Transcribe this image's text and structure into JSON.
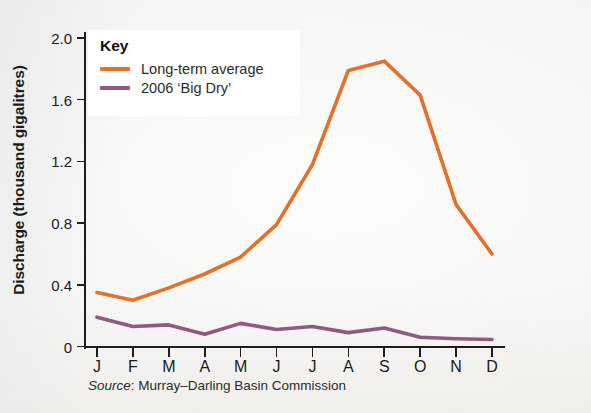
{
  "chart_data": {
    "type": "line",
    "title": "",
    "xlabel": "",
    "ylabel": "Discharge (thousand gigalitres)",
    "categories": [
      "J",
      "F",
      "M",
      "A",
      "M",
      "J",
      "J",
      "A",
      "S",
      "O",
      "N",
      "D"
    ],
    "ylim": [
      0,
      2.0
    ],
    "yticks": [
      0,
      0.4,
      0.8,
      1.2,
      1.6,
      2.0
    ],
    "ytick_labels": [
      "0",
      "0.4",
      "0.8",
      "1.2",
      "1.6",
      "2.0"
    ],
    "grid": false,
    "legend_position": "top-left",
    "series": [
      {
        "name": "Long-term average",
        "color": "#E2712B",
        "values": [
          0.35,
          0.3,
          0.38,
          0.47,
          0.58,
          0.79,
          1.18,
          1.79,
          1.85,
          1.63,
          0.92,
          0.6
        ]
      },
      {
        "name": "2006 ‘Big Dry’",
        "color": "#8E5A80",
        "values": [
          0.19,
          0.13,
          0.14,
          0.08,
          0.15,
          0.11,
          0.13,
          0.09,
          0.12,
          0.06,
          0.05,
          0.045
        ]
      }
    ]
  },
  "legend": {
    "title": "Key",
    "entries": [
      {
        "label": "Long-term average",
        "color": "#E2712B"
      },
      {
        "label": "2006 ‘Big Dry’",
        "color": "#8E5A80"
      }
    ]
  },
  "axes": {
    "y_title": "Discharge (thousand gigalitres)"
  },
  "source": {
    "prefix": "Source",
    "separator": ": ",
    "text": "Murray–Darling Basin Commission"
  }
}
